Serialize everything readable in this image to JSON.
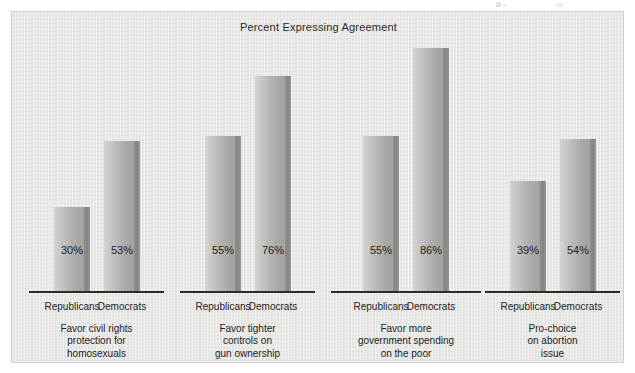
{
  "chart_data": {
    "type": "bar",
    "title": "Percent Expressing Agreement",
    "xlabel": "",
    "ylabel": "",
    "ylim": [
      0,
      100
    ],
    "grid": false,
    "legend": "none",
    "categories": [
      "Favor civil rights protection for homosexuals",
      "Favor tighter controls on gun ownership",
      "Favor more government spending on the poor",
      "Pro-choice on abortion issue"
    ],
    "series": [
      {
        "name": "Republicans",
        "values": [
          30,
          55,
          55,
          39
        ]
      },
      {
        "name": "Democrats",
        "values": [
          53,
          76,
          86,
          54
        ]
      }
    ],
    "value_labels": [
      "30%",
      "53%",
      "55%",
      "76%",
      "55%",
      "86%",
      "39%",
      "54%"
    ],
    "colors": {
      "bar_face_light": "#d3d3d1",
      "bar_face_dark": "#a2a2a0",
      "bar_edge": "#85857f",
      "panel_background": "#e8e8e6",
      "axis": "#2b2b2b",
      "text": "#232323"
    }
  },
  "title": "Percent Expressing Agreement",
  "groups": [
    {
      "caption_lines": [
        "Favor civil rights",
        "protection for",
        "homosexuals"
      ],
      "bars": [
        {
          "party": "Republicans",
          "value": 30,
          "label": "30%"
        },
        {
          "party": "Democrats",
          "value": 53,
          "label": "53%"
        }
      ]
    },
    {
      "caption_lines": [
        "Favor tighter",
        "controls on",
        "gun ownership"
      ],
      "bars": [
        {
          "party": "Republicans",
          "value": 55,
          "label": "55%"
        },
        {
          "party": "Democrats",
          "value": 76,
          "label": "76%"
        }
      ]
    },
    {
      "caption_lines": [
        "Favor more",
        "government spending",
        "on the poor"
      ],
      "bars": [
        {
          "party": "Republicans",
          "value": 55,
          "label": "55%"
        },
        {
          "party": "Democrats",
          "value": 86,
          "label": "86%"
        }
      ]
    },
    {
      "caption_lines": [
        "Pro-choice",
        "on abortion",
        "issue"
      ],
      "bars": [
        {
          "party": "Republicans",
          "value": 39,
          "label": "39%"
        },
        {
          "party": "Democrats",
          "value": 54,
          "label": "54%"
        }
      ]
    }
  ]
}
